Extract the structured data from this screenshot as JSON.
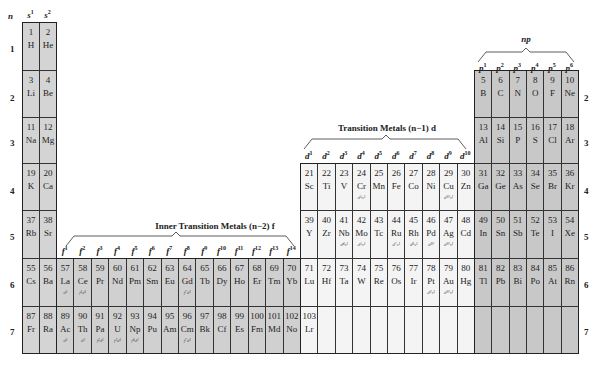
{
  "header": {
    "n_label": "n",
    "s_headers": [
      "s1",
      "s2"
    ],
    "p_title": "np",
    "p_headers": [
      "p1",
      "p2",
      "p3",
      "p4",
      "p5",
      "p6"
    ],
    "d_title": "Transition Metals (n−1) d",
    "d_headers": [
      "d1",
      "d2",
      "d3",
      "d4",
      "d5",
      "d6",
      "d7",
      "d8",
      "d9",
      "d10"
    ],
    "f_title": "Inner Transition Metals (n−2) f",
    "f_headers": [
      "f1",
      "f2",
      "f3",
      "f4",
      "f5",
      "f6",
      "f7",
      "f8",
      "f9",
      "f10",
      "f11",
      "f12",
      "f13",
      "f14"
    ]
  },
  "row_labels": [
    "1",
    "2",
    "3",
    "4",
    "5",
    "6",
    "7"
  ],
  "colors": {
    "s_block": "#d4d4d4",
    "f_block": "#d0d0d0",
    "d_block": "#f4f4f4",
    "p_block": "#c8c8c8",
    "border": "#333333"
  },
  "elements": [
    {
      "n": "1",
      "sym": "H",
      "row": 1,
      "col": 0,
      "block": "s"
    },
    {
      "n": "2",
      "sym": "He",
      "row": 1,
      "col": 1,
      "block": "s"
    },
    {
      "n": "3",
      "sym": "Li",
      "row": 2,
      "col": 0,
      "block": "s"
    },
    {
      "n": "4",
      "sym": "Be",
      "row": 2,
      "col": 1,
      "block": "s"
    },
    {
      "n": "5",
      "sym": "B",
      "row": 2,
      "col": 26,
      "block": "p"
    },
    {
      "n": "6",
      "sym": "C",
      "row": 2,
      "col": 27,
      "block": "p"
    },
    {
      "n": "7",
      "sym": "N",
      "row": 2,
      "col": 28,
      "block": "p"
    },
    {
      "n": "8",
      "sym": "O",
      "row": 2,
      "col": 29,
      "block": "p"
    },
    {
      "n": "9",
      "sym": "F",
      "row": 2,
      "col": 30,
      "block": "p"
    },
    {
      "n": "10",
      "sym": "Ne",
      "row": 2,
      "col": 31,
      "block": "p"
    },
    {
      "n": "11",
      "sym": "Na",
      "row": 3,
      "col": 0,
      "block": "s"
    },
    {
      "n": "12",
      "sym": "Mg",
      "row": 3,
      "col": 1,
      "block": "s"
    },
    {
      "n": "13",
      "sym": "Al",
      "row": 3,
      "col": 26,
      "block": "p"
    },
    {
      "n": "14",
      "sym": "Si",
      "row": 3,
      "col": 27,
      "block": "p"
    },
    {
      "n": "15",
      "sym": "P",
      "row": 3,
      "col": 28,
      "block": "p"
    },
    {
      "n": "16",
      "sym": "S",
      "row": 3,
      "col": 29,
      "block": "p"
    },
    {
      "n": "17",
      "sym": "Cl",
      "row": 3,
      "col": 30,
      "block": "p"
    },
    {
      "n": "18",
      "sym": "Ar",
      "row": 3,
      "col": 31,
      "block": "p"
    },
    {
      "n": "19",
      "sym": "K",
      "row": 4,
      "col": 0,
      "block": "s"
    },
    {
      "n": "20",
      "sym": "Ca",
      "row": 4,
      "col": 1,
      "block": "s"
    },
    {
      "n": "21",
      "sym": "Sc",
      "row": 4,
      "col": 16,
      "block": "d"
    },
    {
      "n": "22",
      "sym": "Ti",
      "row": 4,
      "col": 17,
      "block": "d"
    },
    {
      "n": "23",
      "sym": "V",
      "row": 4,
      "col": 18,
      "block": "d"
    },
    {
      "n": "24",
      "sym": "Cr",
      "row": 4,
      "col": 19,
      "block": "d",
      "cfg": "d⁵s¹"
    },
    {
      "n": "25",
      "sym": "Mn",
      "row": 4,
      "col": 20,
      "block": "d"
    },
    {
      "n": "26",
      "sym": "Fe",
      "row": 4,
      "col": 21,
      "block": "d"
    },
    {
      "n": "27",
      "sym": "Co",
      "row": 4,
      "col": 22,
      "block": "d"
    },
    {
      "n": "28",
      "sym": "Ni",
      "row": 4,
      "col": 23,
      "block": "d"
    },
    {
      "n": "29",
      "sym": "Cu",
      "row": 4,
      "col": 24,
      "block": "d",
      "cfg": "d¹⁰s¹"
    },
    {
      "n": "30",
      "sym": "Zn",
      "row": 4,
      "col": 25,
      "block": "d"
    },
    {
      "n": "31",
      "sym": "Ga",
      "row": 4,
      "col": 26,
      "block": "p"
    },
    {
      "n": "32",
      "sym": "Ge",
      "row": 4,
      "col": 27,
      "block": "p"
    },
    {
      "n": "33",
      "sym": "As",
      "row": 4,
      "col": 28,
      "block": "p"
    },
    {
      "n": "34",
      "sym": "Se",
      "row": 4,
      "col": 29,
      "block": "p"
    },
    {
      "n": "35",
      "sym": "Br",
      "row": 4,
      "col": 30,
      "block": "p"
    },
    {
      "n": "36",
      "sym": "Kr",
      "row": 4,
      "col": 31,
      "block": "p"
    },
    {
      "n": "37",
      "sym": "Rb",
      "row": 5,
      "col": 0,
      "block": "s"
    },
    {
      "n": "38",
      "sym": "Sr",
      "row": 5,
      "col": 1,
      "block": "s"
    },
    {
      "n": "39",
      "sym": "Y",
      "row": 5,
      "col": 16,
      "block": "d"
    },
    {
      "n": "40",
      "sym": "Zr",
      "row": 5,
      "col": 17,
      "block": "d"
    },
    {
      "n": "41",
      "sym": "Nb",
      "row": 5,
      "col": 18,
      "block": "d",
      "cfg": "d⁴s¹"
    },
    {
      "n": "42",
      "sym": "Mo",
      "row": 5,
      "col": 19,
      "block": "d",
      "cfg": "d⁵s¹"
    },
    {
      "n": "43",
      "sym": "Tc",
      "row": 5,
      "col": 20,
      "block": "d"
    },
    {
      "n": "44",
      "sym": "Ru",
      "row": 5,
      "col": 21,
      "block": "d",
      "cfg": "d⁷s¹"
    },
    {
      "n": "45",
      "sym": "Rh",
      "row": 5,
      "col": 22,
      "block": "d",
      "cfg": "d⁸s¹"
    },
    {
      "n": "46",
      "sym": "Pd",
      "row": 5,
      "col": 23,
      "block": "d",
      "cfg": "d¹⁰"
    },
    {
      "n": "47",
      "sym": "Ag",
      "row": 5,
      "col": 24,
      "block": "d",
      "cfg": "d¹⁰s¹"
    },
    {
      "n": "48",
      "sym": "Cd",
      "row": 5,
      "col": 25,
      "block": "d"
    },
    {
      "n": "49",
      "sym": "In",
      "row": 5,
      "col": 26,
      "block": "p"
    },
    {
      "n": "50",
      "sym": "Sn",
      "row": 5,
      "col": 27,
      "block": "p"
    },
    {
      "n": "51",
      "sym": "Sb",
      "row": 5,
      "col": 28,
      "block": "p"
    },
    {
      "n": "52",
      "sym": "Te",
      "row": 5,
      "col": 29,
      "block": "p"
    },
    {
      "n": "53",
      "sym": "I",
      "row": 5,
      "col": 30,
      "block": "p"
    },
    {
      "n": "54",
      "sym": "Xe",
      "row": 5,
      "col": 31,
      "block": "p"
    },
    {
      "n": "55",
      "sym": "Cs",
      "row": 6,
      "col": 0,
      "block": "s"
    },
    {
      "n": "56",
      "sym": "Ba",
      "row": 6,
      "col": 1,
      "block": "s"
    },
    {
      "n": "57",
      "sym": "La",
      "row": 6,
      "col": 2,
      "block": "f",
      "cfg": "d¹"
    },
    {
      "n": "58",
      "sym": "Ce",
      "row": 6,
      "col": 3,
      "block": "f",
      "cfg": "f¹d¹"
    },
    {
      "n": "59",
      "sym": "Pr",
      "row": 6,
      "col": 4,
      "block": "f"
    },
    {
      "n": "60",
      "sym": "Nd",
      "row": 6,
      "col": 5,
      "block": "f"
    },
    {
      "n": "61",
      "sym": "Pm",
      "row": 6,
      "col": 6,
      "block": "f"
    },
    {
      "n": "62",
      "sym": "Sm",
      "row": 6,
      "col": 7,
      "block": "f"
    },
    {
      "n": "63",
      "sym": "Eu",
      "row": 6,
      "col": 8,
      "block": "f"
    },
    {
      "n": "64",
      "sym": "Gd",
      "row": 6,
      "col": 9,
      "block": "f",
      "cfg": "f⁷d¹"
    },
    {
      "n": "65",
      "sym": "Tb",
      "row": 6,
      "col": 10,
      "block": "f"
    },
    {
      "n": "66",
      "sym": "Dy",
      "row": 6,
      "col": 11,
      "block": "f"
    },
    {
      "n": "67",
      "sym": "Ho",
      "row": 6,
      "col": 12,
      "block": "f"
    },
    {
      "n": "68",
      "sym": "Er",
      "row": 6,
      "col": 13,
      "block": "f"
    },
    {
      "n": "69",
      "sym": "Tm",
      "row": 6,
      "col": 14,
      "block": "f"
    },
    {
      "n": "70",
      "sym": "Yb",
      "row": 6,
      "col": 15,
      "block": "f"
    },
    {
      "n": "71",
      "sym": "Lu",
      "row": 6,
      "col": 16,
      "block": "d"
    },
    {
      "n": "72",
      "sym": "Hf",
      "row": 6,
      "col": 17,
      "block": "d"
    },
    {
      "n": "73",
      "sym": "Ta",
      "row": 6,
      "col": 18,
      "block": "d"
    },
    {
      "n": "74",
      "sym": "W",
      "row": 6,
      "col": 19,
      "block": "d"
    },
    {
      "n": "75",
      "sym": "Re",
      "row": 6,
      "col": 20,
      "block": "d"
    },
    {
      "n": "76",
      "sym": "Os",
      "row": 6,
      "col": 21,
      "block": "d"
    },
    {
      "n": "77",
      "sym": "Ir",
      "row": 6,
      "col": 22,
      "block": "d"
    },
    {
      "n": "78",
      "sym": "Pt",
      "row": 6,
      "col": 23,
      "block": "d",
      "cfg": "d⁹s¹"
    },
    {
      "n": "79",
      "sym": "Au",
      "row": 6,
      "col": 24,
      "block": "d",
      "cfg": "d¹⁰s¹"
    },
    {
      "n": "80",
      "sym": "Hg",
      "row": 6,
      "col": 25,
      "block": "d"
    },
    {
      "n": "81",
      "sym": "Tl",
      "row": 6,
      "col": 26,
      "block": "p"
    },
    {
      "n": "82",
      "sym": "Pb",
      "row": 6,
      "col": 27,
      "block": "p"
    },
    {
      "n": "83",
      "sym": "Bi",
      "row": 6,
      "col": 28,
      "block": "p"
    },
    {
      "n": "84",
      "sym": "Po",
      "row": 6,
      "col": 29,
      "block": "p"
    },
    {
      "n": "85",
      "sym": "At",
      "row": 6,
      "col": 30,
      "block": "p"
    },
    {
      "n": "86",
      "sym": "Rn",
      "row": 6,
      "col": 31,
      "block": "p"
    },
    {
      "n": "87",
      "sym": "Fr",
      "row": 7,
      "col": 0,
      "block": "s"
    },
    {
      "n": "88",
      "sym": "Ra",
      "row": 7,
      "col": 1,
      "block": "s"
    },
    {
      "n": "89",
      "sym": "Ac",
      "row": 7,
      "col": 2,
      "block": "f",
      "cfg": "d¹"
    },
    {
      "n": "90",
      "sym": "Th",
      "row": 7,
      "col": 3,
      "block": "f",
      "cfg": "d²"
    },
    {
      "n": "91",
      "sym": "Pa",
      "row": 7,
      "col": 4,
      "block": "f",
      "cfg": "f²d¹"
    },
    {
      "n": "92",
      "sym": "U",
      "row": 7,
      "col": 5,
      "block": "f",
      "cfg": "f³d¹"
    },
    {
      "n": "93",
      "sym": "Np",
      "row": 7,
      "col": 6,
      "block": "f",
      "cfg": "f⁴d¹"
    },
    {
      "n": "94",
      "sym": "Pu",
      "row": 7,
      "col": 7,
      "block": "f"
    },
    {
      "n": "95",
      "sym": "Am",
      "row": 7,
      "col": 8,
      "block": "f"
    },
    {
      "n": "96",
      "sym": "Cm",
      "row": 7,
      "col": 9,
      "block": "f",
      "cfg": "f⁷d¹"
    },
    {
      "n": "97",
      "sym": "Bk",
      "row": 7,
      "col": 10,
      "block": "f"
    },
    {
      "n": "98",
      "sym": "Cf",
      "row": 7,
      "col": 11,
      "block": "f"
    },
    {
      "n": "99",
      "sym": "Es",
      "row": 7,
      "col": 12,
      "block": "f"
    },
    {
      "n": "100",
      "sym": "Fm",
      "row": 7,
      "col": 13,
      "block": "f"
    },
    {
      "n": "101",
      "sym": "Md",
      "row": 7,
      "col": 14,
      "block": "f"
    },
    {
      "n": "102",
      "sym": "No",
      "row": 7,
      "col": 15,
      "block": "f"
    },
    {
      "n": "103",
      "sym": "Lr",
      "row": 7,
      "col": 16,
      "block": "d"
    },
    {
      "n": "",
      "sym": "",
      "row": 7,
      "col": 17,
      "block": "d"
    },
    {
      "n": "",
      "sym": "",
      "row": 7,
      "col": 18,
      "block": "d"
    },
    {
      "n": "",
      "sym": "",
      "row": 7,
      "col": 19,
      "block": "d"
    },
    {
      "n": "",
      "sym": "",
      "row": 7,
      "col": 20,
      "block": "d"
    },
    {
      "n": "",
      "sym": "",
      "row": 7,
      "col": 21,
      "block": "d"
    },
    {
      "n": "",
      "sym": "",
      "row": 7,
      "col": 22,
      "block": "d"
    },
    {
      "n": "",
      "sym": "",
      "row": 7,
      "col": 23,
      "block": "d"
    },
    {
      "n": "",
      "sym": "",
      "row": 7,
      "col": 24,
      "block": "d"
    },
    {
      "n": "",
      "sym": "",
      "row": 7,
      "col": 25,
      "block": "d"
    },
    {
      "n": "",
      "sym": "",
      "row": 7,
      "col": 26,
      "block": "p"
    },
    {
      "n": "",
      "sym": "",
      "row": 7,
      "col": 27,
      "block": "p"
    },
    {
      "n": "",
      "sym": "",
      "row": 7,
      "col": 28,
      "block": "p"
    },
    {
      "n": "",
      "sym": "",
      "row": 7,
      "col": 29,
      "block": "p"
    },
    {
      "n": "",
      "sym": "",
      "row": 7,
      "col": 30,
      "block": "p"
    },
    {
      "n": "",
      "sym": "",
      "row": 7,
      "col": 31,
      "block": "p"
    }
  ]
}
